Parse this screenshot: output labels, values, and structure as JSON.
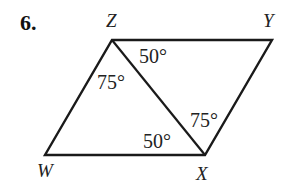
{
  "problem": {
    "number": "6."
  },
  "figure": {
    "type": "parallelogram with diagonal",
    "vertices": {
      "Z": {
        "label": "Z",
        "x": 112,
        "y": 40
      },
      "Y": {
        "label": "Y",
        "x": 272,
        "y": 40
      },
      "X": {
        "label": "X",
        "x": 205,
        "y": 155
      },
      "W": {
        "label": "W",
        "x": 45,
        "y": 155
      }
    },
    "segments": [
      "ZY",
      "YX",
      "XW",
      "WZ",
      "ZX"
    ],
    "angles": [
      {
        "id": "angle-YZX",
        "value": "50°",
        "at": "Z",
        "between": "ZY-ZX"
      },
      {
        "id": "angle-WZX",
        "value": "75°",
        "at": "Z",
        "between": "ZW-ZX"
      },
      {
        "id": "angle-ZXY",
        "value": "75°",
        "at": "X",
        "between": "XZ-XY"
      },
      {
        "id": "angle-WXZ",
        "value": "50°",
        "at": "X",
        "between": "XW-XZ"
      }
    ],
    "stroke_color": "#1a1a1a"
  }
}
